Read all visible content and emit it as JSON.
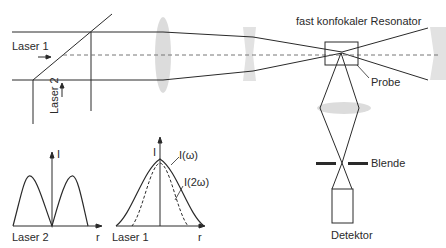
{
  "diagram": {
    "title": "fast konfokaler Resonator",
    "labels": {
      "laser1": "Laser 1",
      "laser2": "Laser 2",
      "probe": "Probe",
      "blende": "Blende",
      "detektor": "Detektor",
      "resonator": "fast konfokaler Resonator"
    },
    "plots": {
      "laser2": {
        "label": "Laser 2",
        "y_axis": "I",
        "x_axis": "r"
      },
      "laser1": {
        "label": "Laser 1",
        "y_axis": "I",
        "x_axis": "r",
        "curve1": "I(ω)",
        "curve2": "I(2ω)"
      }
    },
    "colors": {
      "line": "#2a2a2a",
      "lens": "#dcdcdc",
      "dash": "#666666"
    }
  }
}
